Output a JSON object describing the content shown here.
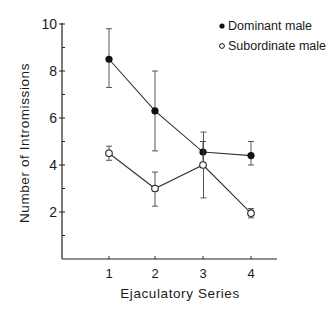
{
  "chart_data": {
    "type": "line",
    "title": "",
    "xlabel": "Ejaculatory Series",
    "ylabel": "Number of Intromissions",
    "x": [
      1,
      2,
      3,
      4
    ],
    "xticks": [
      "1",
      "2",
      "3",
      "4"
    ],
    "yticks": [
      "2",
      "4",
      "6",
      "8",
      "10"
    ],
    "ylim": [
      0,
      10
    ],
    "xlim": [
      0,
      4.6
    ],
    "grid": false,
    "legend_position": "upper right",
    "series": [
      {
        "name": "Dominant male",
        "marker": "filled-circle",
        "values": [
          8.5,
          6.3,
          4.55,
          4.4
        ],
        "err_low": [
          7.3,
          4.6,
          4.1,
          4.0
        ],
        "err_high": [
          9.8,
          8.0,
          5.0,
          5.0
        ]
      },
      {
        "name": "Subordinate male",
        "marker": "open-circle",
        "values": [
          4.5,
          3.0,
          4.0,
          1.95
        ],
        "err_low": [
          4.2,
          2.25,
          2.6,
          1.75
        ],
        "err_high": [
          4.8,
          3.7,
          5.4,
          2.15
        ]
      }
    ]
  },
  "legend": {
    "items": [
      {
        "label": "Dominant male",
        "marker": "filled-circle"
      },
      {
        "label": "Subordinate male",
        "marker": "open-circle"
      }
    ]
  },
  "axes": {
    "xlabel": "Ejaculatory Series",
    "ylabel": "Number of Intromissions"
  }
}
